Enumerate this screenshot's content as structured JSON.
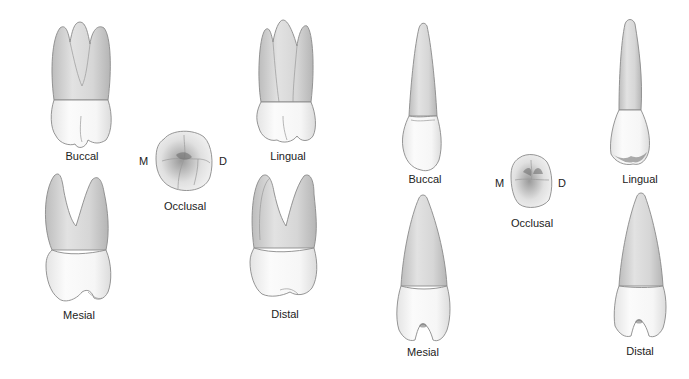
{
  "figure": {
    "panels": [
      {
        "id": "molar",
        "tooth_type": "maxillary molar (three roots)",
        "views": [
          {
            "key": "buccal",
            "label": "Buccal"
          },
          {
            "key": "lingual",
            "label": "Lingual"
          },
          {
            "key": "mesial",
            "label": "Mesial"
          },
          {
            "key": "distal",
            "label": "Distal"
          },
          {
            "key": "occlusal",
            "label": "Occlusal"
          }
        ],
        "orientation": {
          "mesial": "M",
          "distal": "D"
        }
      },
      {
        "id": "single-root",
        "tooth_type": "single-rooted tooth",
        "views": [
          {
            "key": "buccal",
            "label": "Buccal"
          },
          {
            "key": "lingual",
            "label": "Lingual"
          },
          {
            "key": "mesial",
            "label": "Mesial"
          },
          {
            "key": "distal",
            "label": "Distal"
          },
          {
            "key": "occlusal",
            "label": "Occlusal"
          }
        ],
        "orientation": {
          "mesial": "M",
          "distal": "D"
        }
      }
    ]
  },
  "colors": {
    "background": "#ffffff",
    "outline": "#8a8a8a",
    "root_shade": "#cfcfcf",
    "crown_fill": "#f7f7f7",
    "text": "#222222"
  }
}
